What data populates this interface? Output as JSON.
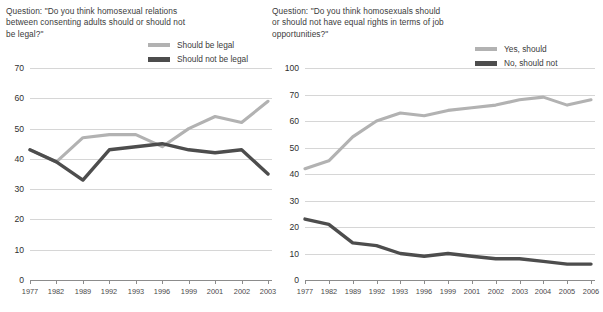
{
  "charts": [
    {
      "id": "legal-relations",
      "question": "Question: \"Do you think homosexual relations between consenting adults should or should not be legal?\"",
      "legend": [
        {
          "key": "light",
          "label": "Should be legal",
          "color": "#b2b2b2"
        },
        {
          "key": "dark",
          "label": "Should not be legal",
          "color": "#4d4d4d"
        }
      ],
      "chart_data": {
        "type": "line",
        "title": "Question: \"Do you think homosexual relations between consenting adults should or should not be legal?\"",
        "xlabel": "",
        "ylabel": "",
        "ylim": [
          0,
          70
        ],
        "yticks": [
          0,
          10,
          20,
          30,
          40,
          50,
          60,
          70
        ],
        "grid": true,
        "legend_position": "top-right",
        "x": [
          1977,
          1982,
          1989,
          1992,
          1993,
          1996,
          1999,
          2001,
          2002,
          2003
        ],
        "categories": [
          "1977",
          "1982",
          "1989",
          "1992",
          "1993",
          "1996",
          "1999",
          "2001",
          "2002",
          "2003"
        ],
        "series": [
          {
            "name": "Should be legal",
            "color": "#b2b2b2",
            "values": [
              43,
              39,
              47,
              48,
              48,
              44,
              50,
              54,
              52,
              59
            ]
          },
          {
            "name": "Should not be legal",
            "color": "#4d4d4d",
            "values": [
              43,
              39,
              33,
              43,
              44,
              45,
              43,
              42,
              43,
              35
            ]
          }
        ]
      }
    },
    {
      "id": "equal-job-rights",
      "question": "Question: \"Do you think homosexuals should or should not have equal rights in terms of job opportunities?\"",
      "legend": [
        {
          "key": "light",
          "label": "Yes, should",
          "color": "#b2b2b2"
        },
        {
          "key": "dark",
          "label": "No, should not",
          "color": "#4d4d4d"
        }
      ],
      "chart_data": {
        "type": "line",
        "title": "Question: \"Do you think homosexuals should or should not have equal rights in terms of job opportunities?\"",
        "xlabel": "",
        "ylabel": "",
        "ylim": [
          0,
          100
        ],
        "yticks": [
          0,
          10,
          20,
          30,
          40,
          50,
          60,
          70,
          100
        ],
        "y_axis_note": "irregular scale: 0-70 evenly spaced, then 100 at top",
        "grid": true,
        "legend_position": "top-right",
        "x": [
          1977,
          1982,
          1989,
          1992,
          1993,
          1996,
          1999,
          2001,
          2002,
          2003,
          2004,
          2005,
          2006
        ],
        "categories": [
          "1977",
          "1982",
          "1989",
          "1992",
          "1993",
          "1996",
          "1999",
          "2001",
          "2002",
          "2003",
          "2004",
          "2005",
          "2006"
        ],
        "series": [
          {
            "name": "Yes, should",
            "color": "#b2b2b2",
            "values": [
              42,
              45,
              54,
              60,
              63,
              62,
              64,
              65,
              66,
              68,
              69,
              66,
              68
            ]
          },
          {
            "name": "No, should not",
            "color": "#4d4d4d",
            "values": [
              23,
              21,
              14,
              13,
              10,
              9,
              10,
              9,
              8,
              8,
              7,
              6,
              6
            ]
          }
        ]
      }
    }
  ]
}
